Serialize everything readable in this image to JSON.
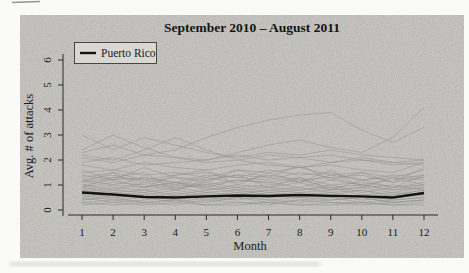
{
  "figure": {
    "colors": {
      "page_bg": "#fafaf8",
      "panel_bg": "#d8d7d2",
      "gray_line": "#8f8f8c",
      "highlight_line": "#141414",
      "text": "#1c1c1c"
    }
  },
  "chart_data": {
    "type": "line",
    "title": "September 2010 – August 2011",
    "xlabel": "Month",
    "ylabel": "Avg. # of attacks",
    "x": [
      1,
      2,
      3,
      4,
      5,
      6,
      7,
      8,
      9,
      10,
      11,
      12
    ],
    "x_ticks": [
      1,
      2,
      3,
      4,
      5,
      6,
      7,
      8,
      9,
      10,
      11,
      12
    ],
    "y_ticks": [
      0,
      1,
      2,
      3,
      4,
      5,
      6
    ],
    "xlim": [
      1,
      12
    ],
    "ylim": [
      0,
      6
    ],
    "grid": false,
    "legend_position": "top-left",
    "series": [
      {
        "name": "Puerto Rico",
        "color": "#141414",
        "highlight": true,
        "values": [
          0.7,
          0.62,
          0.52,
          0.5,
          0.55,
          0.58,
          0.56,
          0.6,
          0.57,
          0.55,
          0.5,
          0.68
        ]
      }
    ],
    "other_series": [
      [
        2.1,
        1.9,
        2.2,
        2.4,
        2.9,
        3.3,
        3.6,
        3.8,
        3.9,
        3.2,
        2.7,
        3.3
      ],
      [
        2.3,
        2.6,
        2.2,
        2.1,
        2.0,
        2.3,
        2.6,
        2.8,
        2.5,
        2.3,
        2.9,
        4.1
      ],
      [
        3.0,
        2.4,
        2.9,
        2.6,
        2.3,
        2.1,
        2.3,
        2.2,
        2.4,
        2.2,
        2.1,
        2.0
      ],
      [
        2.4,
        3.0,
        2.5,
        2.1,
        1.9,
        2.0,
        2.2,
        2.1,
        1.9,
        2.0,
        1.8,
        1.9
      ],
      [
        2.2,
        2.0,
        2.4,
        2.9,
        2.4,
        2.0,
        1.8,
        1.7,
        1.9,
        2.1,
        1.9,
        1.8
      ],
      [
        1.9,
        2.1,
        1.8,
        1.9,
        2.0,
        2.2,
        2.0,
        2.1,
        2.2,
        2.0,
        1.9,
        2.0
      ],
      [
        1.8,
        1.6,
        1.9,
        1.7,
        1.6,
        1.8,
        1.9,
        1.7,
        1.8,
        1.6,
        1.5,
        1.9
      ],
      [
        1.6,
        1.2,
        1.7,
        1.3,
        1.1,
        1.6,
        1.3,
        1.8,
        1.2,
        1.5,
        1.1,
        1.7
      ],
      [
        1.1,
        1.5,
        0.9,
        1.4,
        1.6,
        1.0,
        1.5,
        1.1,
        1.6,
        0.9,
        1.3,
        1.0
      ],
      [
        0.9,
        1.3,
        1.5,
        0.8,
        1.2,
        1.4,
        0.9,
        1.3,
        0.8,
        1.2,
        0.9,
        1.4
      ],
      [
        1.5,
        1.6,
        1.4,
        1.5,
        1.3,
        1.6,
        1.5,
        1.7,
        1.4,
        1.5,
        1.3,
        1.6
      ],
      [
        1.3,
        1.5,
        1.2,
        1.4,
        1.5,
        1.3,
        1.6,
        1.4,
        1.5,
        1.2,
        1.4,
        1.3
      ],
      [
        1.4,
        1.2,
        1.3,
        1.1,
        1.4,
        1.3,
        1.2,
        1.5,
        1.3,
        1.4,
        1.1,
        1.3
      ],
      [
        1.2,
        1.4,
        1.1,
        1.3,
        1.2,
        1.4,
        1.3,
        1.1,
        1.4,
        1.2,
        1.3,
        1.2
      ],
      [
        1.1,
        1.3,
        1.2,
        1.0,
        1.3,
        1.1,
        1.4,
        1.2,
        1.3,
        1.0,
        1.2,
        1.4
      ],
      [
        1.2,
        1.0,
        1.3,
        1.1,
        0.9,
        1.2,
        1.1,
        1.3,
        1.0,
        1.1,
        0.9,
        1.1
      ],
      [
        1.0,
        1.2,
        0.9,
        1.1,
        1.0,
        1.2,
        1.1,
        0.9,
        1.2,
        1.0,
        0.8,
        1.0
      ],
      [
        0.9,
        1.1,
        1.0,
        0.8,
        1.1,
        0.9,
        1.0,
        1.2,
        0.9,
        1.0,
        0.8,
        0.9
      ],
      [
        1.0,
        0.8,
        1.1,
        0.9,
        1.0,
        0.8,
        0.9,
        1.1,
        0.8,
        0.9,
        1.0,
        0.8
      ],
      [
        0.8,
        1.0,
        0.9,
        1.1,
        0.8,
        1.0,
        0.9,
        0.8,
        1.0,
        0.7,
        0.9,
        1.0
      ],
      [
        0.9,
        0.7,
        0.8,
        1.0,
        0.9,
        0.7,
        0.8,
        0.9,
        0.7,
        0.8,
        0.6,
        0.8
      ],
      [
        0.7,
        0.9,
        0.8,
        0.6,
        0.8,
        0.9,
        0.7,
        0.8,
        0.9,
        0.6,
        0.7,
        0.9
      ],
      [
        0.8,
        0.6,
        0.7,
        0.9,
        0.7,
        0.8,
        0.6,
        0.7,
        0.8,
        0.9,
        0.7,
        0.6
      ],
      [
        0.6,
        0.8,
        0.7,
        0.5,
        0.7,
        0.6,
        0.8,
        0.7,
        0.6,
        0.8,
        0.5,
        0.7
      ],
      [
        0.7,
        0.5,
        0.6,
        0.8,
        0.6,
        0.7,
        0.5,
        0.6,
        0.7,
        0.5,
        0.6,
        0.8
      ],
      [
        0.5,
        0.7,
        0.6,
        0.4,
        0.6,
        0.5,
        0.7,
        0.6,
        0.5,
        0.6,
        0.4,
        0.5
      ],
      [
        0.6,
        0.4,
        0.5,
        0.7,
        0.5,
        0.6,
        0.4,
        0.5,
        0.6,
        0.4,
        0.5,
        0.6
      ],
      [
        0.4,
        0.6,
        0.5,
        0.3,
        0.5,
        0.4,
        0.6,
        0.5,
        0.4,
        0.5,
        0.3,
        0.4
      ],
      [
        0.5,
        0.3,
        0.4,
        0.6,
        0.4,
        0.5,
        0.3,
        0.4,
        0.5,
        0.3,
        0.4,
        0.5
      ],
      [
        0.4,
        0.5,
        0.3,
        0.4,
        0.3,
        0.5,
        0.4,
        0.3,
        0.4,
        0.5,
        0.3,
        0.4
      ],
      [
        0.3,
        0.4,
        0.3,
        0.2,
        0.4,
        0.3,
        0.2,
        0.4,
        0.3,
        0.2,
        0.3,
        0.4
      ],
      [
        0.3,
        0.2,
        0.3,
        0.4,
        0.2,
        0.3,
        0.3,
        0.2,
        0.3,
        0.3,
        0.2,
        0.3
      ],
      [
        0.2,
        0.3,
        0.2,
        0.3,
        0.2,
        0.2,
        0.3,
        0.2,
        0.2,
        0.3,
        0.2,
        0.2
      ]
    ]
  }
}
